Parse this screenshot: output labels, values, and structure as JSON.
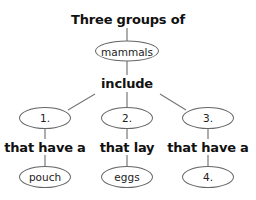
{
  "diagram": {
    "type": "concept-map",
    "top_label": "Three groups of",
    "root_node": "mammals",
    "root_link": "include",
    "branches": [
      {
        "node": "1.",
        "link": "that have a",
        "leaf": "pouch"
      },
      {
        "node": "2.",
        "link": "that lay",
        "leaf": "eggs"
      },
      {
        "node": "3.",
        "link": "that have a",
        "leaf": "4."
      }
    ],
    "colors": {
      "line": "#777777",
      "text": "#111111",
      "ellipse_border": "#666666"
    }
  }
}
